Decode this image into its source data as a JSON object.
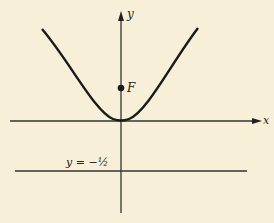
{
  "diagram": {
    "type": "parabola with focus and directrix",
    "curve": "parabola opening upward, vertex at origin",
    "x_axis_label": "x",
    "y_axis_label": "y",
    "focus_label": "F",
    "directrix_label": "y = −½",
    "colors": {
      "background": "#f8efd9",
      "ink": "#222222"
    }
  }
}
